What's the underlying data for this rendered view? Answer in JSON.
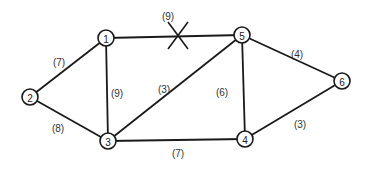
{
  "graph": {
    "nodes": [
      {
        "id": "1",
        "label": "1",
        "x": 106,
        "y": 38
      },
      {
        "id": "2",
        "label": "2",
        "x": 30,
        "y": 97
      },
      {
        "id": "3",
        "label": "3",
        "x": 108,
        "y": 141
      },
      {
        "id": "4",
        "label": "4",
        "x": 245,
        "y": 139
      },
      {
        "id": "5",
        "label": "5",
        "x": 242,
        "y": 35
      },
      {
        "id": "6",
        "label": "6",
        "x": 342,
        "y": 81
      }
    ],
    "edges": [
      {
        "from": "1",
        "to": "5",
        "weight": "(9)",
        "label_x": 168,
        "label_y": 16,
        "removed": true
      },
      {
        "from": "1",
        "to": "2",
        "weight": "(7)",
        "label_x": 59,
        "label_y": 62,
        "removed": false
      },
      {
        "from": "1",
        "to": "3",
        "weight": "(9)",
        "label_x": 117,
        "label_y": 93,
        "removed": false
      },
      {
        "from": "2",
        "to": "3",
        "weight": "(8)",
        "label_x": 58,
        "label_y": 128,
        "removed": false
      },
      {
        "from": "3",
        "to": "5",
        "weight": "(3)",
        "label_x": 164,
        "label_y": 89,
        "removed": false
      },
      {
        "from": "3",
        "to": "4",
        "weight": "(7)",
        "label_x": 178,
        "label_y": 152,
        "removed": false
      },
      {
        "from": "5",
        "to": "4",
        "weight": "(6)",
        "label_x": 222,
        "label_y": 92,
        "removed": false
      },
      {
        "from": "5",
        "to": "6",
        "weight": "(4)",
        "label_x": 297,
        "label_y": 54,
        "removed": false
      },
      {
        "from": "4",
        "to": "6",
        "weight": "(3)",
        "label_x": 300,
        "label_y": 124,
        "removed": false
      }
    ],
    "removed_edge_marker": {
      "x": 178,
      "y": 36,
      "symbol": "X"
    }
  }
}
